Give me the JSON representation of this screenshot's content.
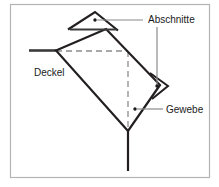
{
  "figure": {
    "background_color": "#ffffff",
    "frame_color": "#b4b4b4",
    "line_color": "#231f20",
    "leader_color": "#808080",
    "dash_color": "#8c8c8c",
    "labels": {
      "abschnitte": "Abschnitte",
      "deckel": "Deckel",
      "gewebe": "Gewebe"
    },
    "markers": {
      "top_flap_dot": "dot-marker",
      "right_flap_dot": "dot-marker",
      "bottom_edge_dot": "dot-marker"
    },
    "shapes": {
      "diamond": "rotated-square-body",
      "top_triangle": "top-flap-triangle",
      "right_triangle": "right-flap-triangle",
      "left_stem": "horizontal-stem-left",
      "bottom_stem": "vertical-stem-bottom",
      "dashed_guide": "dashed-construction-lines"
    }
  }
}
